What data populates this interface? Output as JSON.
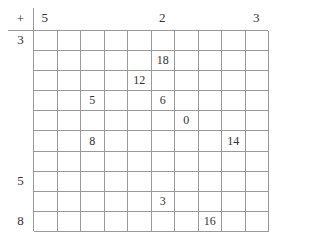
{
  "table": {
    "operator": "+",
    "column_headers": [
      "5",
      "",
      "",
      "",
      "",
      "2",
      "",
      "",
      "",
      "3"
    ],
    "row_headers": [
      "3",
      "",
      "",
      "",
      "",
      "",
      "",
      "5",
      "",
      "8"
    ],
    "cells": [
      [
        "",
        "",
        "",
        "",
        "",
        "",
        "",
        "",
        "",
        ""
      ],
      [
        "",
        "",
        "",
        "",
        "",
        "18",
        "",
        "",
        "",
        ""
      ],
      [
        "",
        "",
        "",
        "",
        "12",
        "",
        "",
        "",
        "",
        ""
      ],
      [
        "",
        "",
        "5",
        "",
        "",
        "6",
        "",
        "",
        "",
        ""
      ],
      [
        "",
        "",
        "",
        "",
        "",
        "",
        "0",
        "",
        "",
        ""
      ],
      [
        "",
        "",
        "8",
        "",
        "",
        "",
        "",
        "",
        "14",
        ""
      ],
      [
        "",
        "",
        "",
        "",
        "",
        "",
        "",
        "",
        "",
        ""
      ],
      [
        "",
        "",
        "",
        "",
        "",
        "",
        "",
        "",
        "",
        ""
      ],
      [
        "",
        "",
        "",
        "",
        "",
        "3",
        "",
        "",
        "",
        ""
      ],
      [
        "",
        "",
        "",
        "",
        "",
        "",
        "",
        "16",
        "",
        ""
      ]
    ]
  }
}
